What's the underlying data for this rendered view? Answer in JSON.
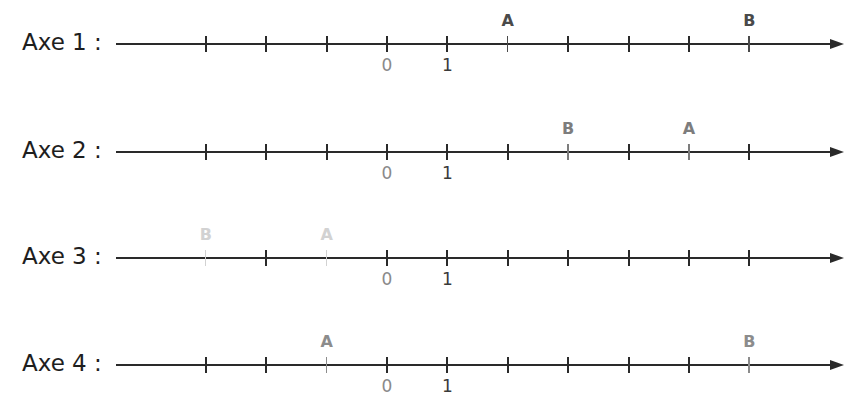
{
  "figure": {
    "tick_spacing_px": 60.4,
    "origin_x_px": 387,
    "tick_values": [
      -3,
      -2,
      -1,
      0,
      1,
      2,
      3,
      4,
      5,
      6
    ],
    "labeled_ticks": [
      {
        "value": 0,
        "text": "0"
      },
      {
        "value": 1,
        "text": "1"
      }
    ]
  },
  "axes": [
    {
      "label": "Axe 1 :",
      "y": 44,
      "points": [
        {
          "name": "A",
          "value": 2,
          "color": "#4a4a4a"
        },
        {
          "name": "B",
          "value": 6,
          "color": "#4a4a4a"
        }
      ]
    },
    {
      "label": "Axe 2 :",
      "y": 152,
      "points": [
        {
          "name": "B",
          "value": 3,
          "color": "#7d7d7d"
        },
        {
          "name": "A",
          "value": 5,
          "color": "#7d7d7d"
        }
      ]
    },
    {
      "label": "Axe 3 :",
      "y": 258,
      "points": [
        {
          "name": "B",
          "value": -3,
          "color": "#d2d2d2"
        },
        {
          "name": "A",
          "value": -1,
          "color": "#d2d2d2"
        }
      ]
    },
    {
      "label": "Axe 4 :",
      "y": 365,
      "points": [
        {
          "name": "A",
          "value": -1,
          "color": "#8c8c8c"
        },
        {
          "name": "B",
          "value": 6,
          "color": "#8c8c8c"
        }
      ]
    }
  ],
  "colors": {
    "line": "#2a2a2a",
    "label_zero": "#8a8a8a",
    "label_one": "#3a3a3a"
  }
}
